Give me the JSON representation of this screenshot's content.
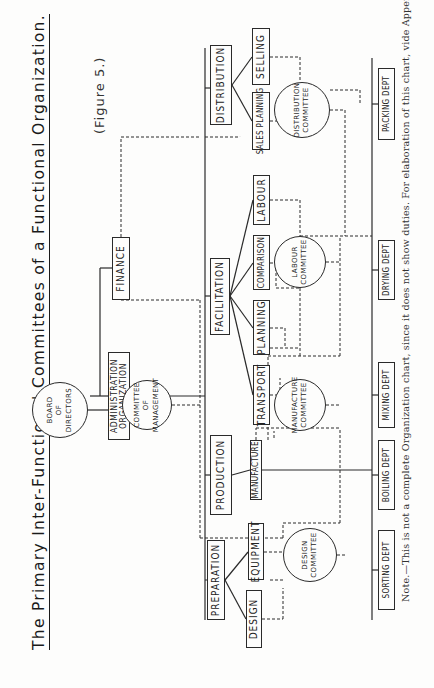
{
  "title": "The Primary Inter-Functional Committees of a Functional Organization.",
  "figure_label": "(Figure 5.)",
  "note": "Note.—This is not a complete Organization chart, since it does not show duties.  For elaboration of this chart, vide Appendix I.",
  "orientation": "rotated 90 degrees counter-clockwise on page",
  "board": {
    "line1": "Board",
    "line2": "of",
    "line3": "Directors"
  },
  "administration": {
    "line1": "Administration",
    "line2": "Organization"
  },
  "committee_of_management": {
    "line1": "Committee",
    "line2": "of",
    "line3": "Management"
  },
  "finance": "Finance",
  "functions": {
    "preparation": {
      "label": "Preparation",
      "children": [
        "Design",
        "Equipment"
      ]
    },
    "production": {
      "label": "Production",
      "children": [
        "Manufacture"
      ]
    },
    "facilitation": {
      "label": "Facilitation",
      "children": [
        "Transport",
        "Planning",
        "Comparison",
        "Labour"
      ]
    },
    "distribution": {
      "label": "Distribution",
      "children": [
        "Sales Planning",
        "Selling"
      ]
    }
  },
  "committees": {
    "design": {
      "line1": "Design",
      "line2": "Committee"
    },
    "manufacture": {
      "line1": "Manufacture",
      "line2": "Committee"
    },
    "labour": {
      "line1": "Labour",
      "line2": "Committee"
    },
    "distribution": {
      "line1": "Distribution",
      "line2": "Committee"
    }
  },
  "departments": [
    "Sorting Dept",
    "Boiling Dept",
    "Mixing Dept",
    "Drying Dept",
    "Packing Dept"
  ],
  "colors": {
    "ink": "#2a2a2a",
    "paper": "#fdfdfc"
  }
}
